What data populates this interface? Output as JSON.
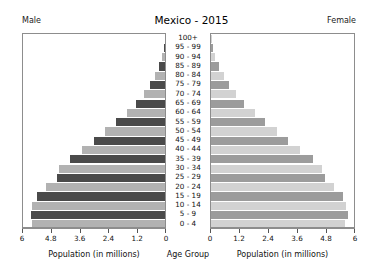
{
  "header": {
    "title": "Mexico - 2015",
    "left_label": "Male",
    "right_label": "Female"
  },
  "axes": {
    "left_title": "Population (in millions)",
    "right_title": "Population (in millions)",
    "center_title": "Age Group",
    "left_ticks": [
      "6",
      "4.8",
      "3.6",
      "2.4",
      "1.2",
      "0"
    ],
    "right_ticks": [
      "0",
      "1.2",
      "2.4",
      "3.6",
      "4.8",
      "6"
    ]
  },
  "colors": {
    "male_dark": "#4a4a4a",
    "male_light": "#b2b2b2",
    "female_dark": "#9c9c9c",
    "female_light": "#d2d2d2",
    "axis": "#8d8d8d",
    "background": "#ffffff"
  },
  "chart_data": {
    "type": "bar",
    "title": "Mexico - 2015",
    "subtitle": "",
    "xlabel": "Population (in millions)",
    "ylabel": "Age Group",
    "xlim": [
      0,
      6
    ],
    "grid": false,
    "legend_position": "top-corners",
    "categories": [
      "100+",
      "95 - 99",
      "90 - 94",
      "85 - 89",
      "80 - 84",
      "75 - 79",
      "70 - 74",
      "65 - 69",
      "60 - 64",
      "55 - 59",
      "50 - 54",
      "45 - 49",
      "40 - 44",
      "35 - 39",
      "30 - 34",
      "25 - 29",
      "20 - 24",
      "15 - 19",
      "10 - 14",
      "5 - 9",
      "0 - 4"
    ],
    "series": [
      {
        "name": "Male",
        "direction": "left",
        "values": [
          0.01,
          0.05,
          0.12,
          0.25,
          0.42,
          0.62,
          0.88,
          1.2,
          1.6,
          2.05,
          2.5,
          2.95,
          3.45,
          3.95,
          4.4,
          4.5,
          4.95,
          5.35,
          5.55,
          5.6,
          5.55
        ]
      },
      {
        "name": "Female",
        "direction": "right",
        "values": [
          0.02,
          0.08,
          0.17,
          0.33,
          0.52,
          0.75,
          1.02,
          1.38,
          1.8,
          2.25,
          2.72,
          3.2,
          3.7,
          4.2,
          4.6,
          4.7,
          5.1,
          5.45,
          5.6,
          5.65,
          5.55
        ]
      }
    ]
  }
}
